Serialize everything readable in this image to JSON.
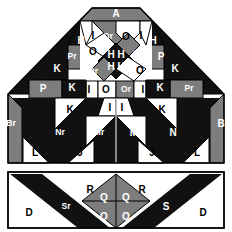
{
  "figure": {
    "name": "pieced-quilt-block-pattern-diagram",
    "palette": {
      "dark": "#111111",
      "gray": "#7d7d7d",
      "light": "#ffffff",
      "outline": "#000000",
      "background": "#ffffff"
    }
  },
  "upper_block": {
    "name": "upper-pentagon-block",
    "pieces": [
      {
        "id": "A",
        "label": "A",
        "shade": "gray",
        "tone": "dark",
        "x": 116,
        "y": 14
      },
      {
        "id": "H-L",
        "label": "H",
        "shade": "dark",
        "tone": "dark",
        "x": 81,
        "y": 41
      },
      {
        "id": "I-TL",
        "label": "I",
        "shade": "light",
        "tone": "light",
        "x": 93,
        "y": 36
      },
      {
        "id": "Or-T",
        "label": "Or",
        "shade": "gray",
        "tone": "dark",
        "x": 108,
        "y": 37
      },
      {
        "id": "O-T",
        "label": "O",
        "shade": "light",
        "tone": "light",
        "x": 126,
        "y": 37
      },
      {
        "id": "I-TR",
        "label": "I",
        "shade": "light",
        "tone": "light",
        "x": 141,
        "y": 36
      },
      {
        "id": "H-R",
        "label": "H",
        "shade": "dark",
        "tone": "dark",
        "x": 153,
        "y": 41
      },
      {
        "id": "Pr",
        "label": "Pr",
        "shade": "gray",
        "tone": "dark",
        "x": 72,
        "y": 57
      },
      {
        "id": "O-UL",
        "label": "O",
        "shade": "light",
        "tone": "light",
        "x": 93,
        "y": 52
      },
      {
        "id": "HH1",
        "label": "HH",
        "shade": "dark",
        "tone": "dark",
        "x": 116,
        "y": 55
      },
      {
        "id": "Or-R",
        "label": "Or",
        "shade": "gray",
        "tone": "dark",
        "x": 138,
        "y": 54
      },
      {
        "id": "P-R",
        "label": "P",
        "shade": "gray",
        "tone": "dark",
        "x": 161,
        "y": 57
      },
      {
        "id": "K-UL",
        "label": "K",
        "shade": "dark",
        "tone": "dark",
        "x": 57,
        "y": 69
      },
      {
        "id": "Or-L",
        "label": "Or",
        "shade": "gray",
        "tone": "dark",
        "x": 93,
        "y": 72
      },
      {
        "id": "HH2",
        "label": "HH",
        "shade": "dark",
        "tone": "dark",
        "x": 116,
        "y": 67
      },
      {
        "id": "O-UR",
        "label": "O",
        "shade": "light",
        "tone": "light",
        "x": 140,
        "y": 71
      },
      {
        "id": "K-UR",
        "label": "K",
        "shade": "dark",
        "tone": "dark",
        "x": 175,
        "y": 69
      },
      {
        "id": "P-L",
        "label": "P",
        "shade": "gray",
        "tone": "dark",
        "x": 43,
        "y": 89
      },
      {
        "id": "K-ML",
        "label": "K",
        "shade": "dark",
        "tone": "dark",
        "x": 72,
        "y": 88
      },
      {
        "id": "I-ML",
        "label": "I",
        "shade": "light",
        "tone": "light",
        "x": 89,
        "y": 90
      },
      {
        "id": "O-B",
        "label": "O",
        "shade": "light",
        "tone": "light",
        "x": 106,
        "y": 90
      },
      {
        "id": "Or-B",
        "label": "Or",
        "shade": "gray",
        "tone": "dark",
        "x": 126,
        "y": 90
      },
      {
        "id": "I-MR",
        "label": "I",
        "shade": "light",
        "tone": "light",
        "x": 143,
        "y": 90
      },
      {
        "id": "K-MR",
        "label": "K",
        "shade": "dark",
        "tone": "dark",
        "x": 160,
        "y": 88
      },
      {
        "id": "Pr-R",
        "label": "Pr",
        "shade": "gray",
        "tone": "dark",
        "x": 189,
        "y": 89
      },
      {
        "id": "K-LL",
        "label": "K",
        "shade": "light",
        "tone": "light",
        "x": 70,
        "y": 110
      },
      {
        "id": "I-BL",
        "label": "I",
        "shade": "light",
        "tone": "light",
        "x": 110,
        "y": 108
      },
      {
        "id": "I-BR",
        "label": "I",
        "shade": "light",
        "tone": "light",
        "x": 122,
        "y": 108
      },
      {
        "id": "K-LR",
        "label": "K",
        "shade": "light",
        "tone": "light",
        "x": 162,
        "y": 110
      },
      {
        "id": "Br",
        "label": "Br",
        "shade": "gray",
        "tone": "dark",
        "x": 11,
        "y": 124
      },
      {
        "id": "Nr",
        "label": "Nr",
        "shade": "dark",
        "tone": "dark",
        "x": 60,
        "y": 133
      },
      {
        "id": "Mr",
        "label": "Mr",
        "shade": "dark",
        "tone": "dark",
        "x": 99,
        "y": 133
      },
      {
        "id": "M",
        "label": "M",
        "shade": "dark",
        "tone": "dark",
        "x": 134,
        "y": 133
      },
      {
        "id": "N",
        "label": "N",
        "shade": "dark",
        "tone": "dark",
        "x": 173,
        "y": 133
      },
      {
        "id": "B",
        "label": "B",
        "shade": "gray",
        "tone": "dark",
        "x": 221,
        "y": 124
      },
      {
        "id": "L-L",
        "label": "L",
        "shade": "light",
        "tone": "light",
        "x": 35,
        "y": 153
      },
      {
        "id": "J-L",
        "label": "J",
        "shade": "light",
        "tone": "light",
        "x": 80,
        "y": 153
      },
      {
        "id": "J-R",
        "label": "J",
        "shade": "light",
        "tone": "light",
        "x": 152,
        "y": 153
      },
      {
        "id": "L-R",
        "label": "L",
        "shade": "light",
        "tone": "light",
        "x": 197,
        "y": 153
      }
    ]
  },
  "lower_block": {
    "name": "lower-border-block",
    "pieces": [
      {
        "id": "D-L",
        "label": "D",
        "shade": "light",
        "tone": "light",
        "x": 29,
        "y": 213
      },
      {
        "id": "Sr",
        "label": "Sr",
        "shade": "dark",
        "tone": "dark",
        "x": 66,
        "y": 207
      },
      {
        "id": "R-L",
        "label": "R",
        "shade": "light",
        "tone": "light",
        "x": 90,
        "y": 190
      },
      {
        "id": "Q-TL",
        "label": "Q",
        "shade": "gray",
        "tone": "dark",
        "x": 104,
        "y": 198
      },
      {
        "id": "Q-TR",
        "label": "Q",
        "shade": "gray",
        "tone": "dark",
        "x": 126,
        "y": 198
      },
      {
        "id": "Q-BL",
        "label": "Q",
        "shade": "gray",
        "tone": "dark",
        "x": 104,
        "y": 217
      },
      {
        "id": "Q-BR",
        "label": "Q",
        "shade": "gray",
        "tone": "dark",
        "x": 126,
        "y": 217
      },
      {
        "id": "R-R",
        "label": "R",
        "shade": "light",
        "tone": "light",
        "x": 142,
        "y": 190
      },
      {
        "id": "S",
        "label": "S",
        "shade": "dark",
        "tone": "dark",
        "x": 166,
        "y": 207
      },
      {
        "id": "D-R",
        "label": "D",
        "shade": "light",
        "tone": "light",
        "x": 203,
        "y": 213
      }
    ]
  }
}
